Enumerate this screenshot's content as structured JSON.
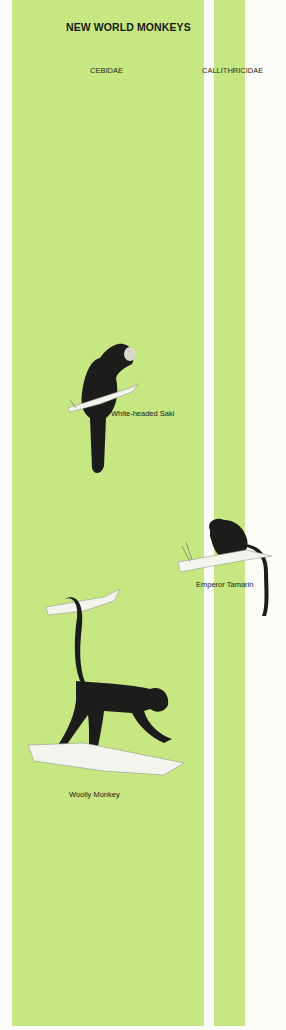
{
  "page": {
    "title": "NEW WORLD MONKEYS",
    "colors": {
      "column_green": "#c6e782",
      "background": "#fbfbf8",
      "text": "#1a1a14",
      "fur": "#1c1c1a",
      "branch": "#f4f4ee"
    }
  },
  "families": [
    {
      "label": "CEBIDAE"
    },
    {
      "label": "CALLITHRICIDAE"
    }
  ],
  "species": [
    {
      "caption": "White-headed Saki",
      "family": "CEBIDAE",
      "icon": "monkey-illustration"
    },
    {
      "caption": "Emperor Tamarin",
      "family": "CALLITHRICIDAE",
      "icon": "monkey-illustration"
    },
    {
      "caption": "Woolly Monkey",
      "family": "CEBIDAE",
      "icon": "monkey-illustration"
    }
  ]
}
